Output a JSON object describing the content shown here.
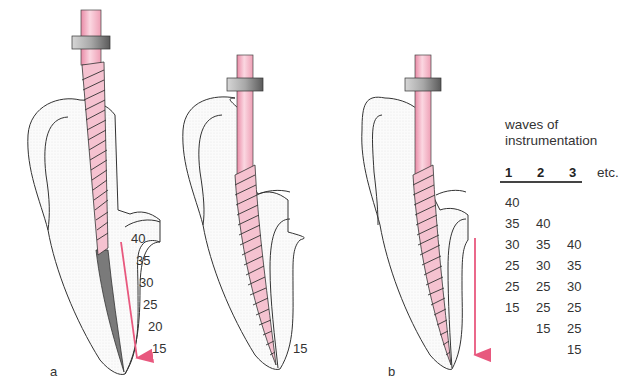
{
  "figure": {
    "panels": [
      {
        "id": "a",
        "label": "a",
        "sizes_down_canal": [
          "40",
          "35",
          "30",
          "25",
          "20",
          "15"
        ]
      },
      {
        "id": "middle",
        "label": "",
        "size_at_apex": "15"
      },
      {
        "id": "b",
        "label": "b"
      }
    ],
    "colors": {
      "instrument": "#f2b9c8",
      "stopper": "#8a8a8a",
      "arrow": "#e8587e",
      "outline": "#333333",
      "canal_dark": "#7a7a7a"
    }
  },
  "table": {
    "title_line1": "waves of",
    "title_line2": "instrumentation",
    "headers": [
      "1",
      "2",
      "3"
    ],
    "etc_label": "etc.",
    "columns": [
      [
        "40",
        "35",
        "30",
        "25",
        "25",
        "15"
      ],
      [
        "40",
        "35",
        "30",
        "25",
        "25",
        "15"
      ],
      [
        "40",
        "35",
        "30",
        "25",
        "25",
        "15"
      ]
    ]
  }
}
